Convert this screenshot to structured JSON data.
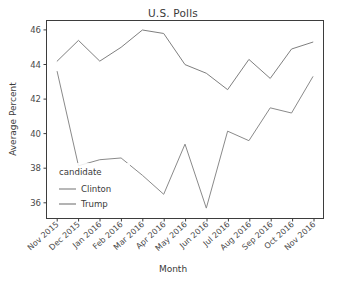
{
  "chart_data": {
    "type": "line",
    "title": "U.S. Polls",
    "xlabel": "Month",
    "ylabel": "Average Percent",
    "categories": [
      "Nov 2015",
      "Dec 2015",
      "Jan 2016",
      "Feb 2016",
      "Mar 2016",
      "Apr 2016",
      "May 2016",
      "Jun 2016",
      "Jul 2016",
      "Aug 2016",
      "Sep 2016",
      "Oct 2016",
      "Nov 2016"
    ],
    "series": [
      {
        "name": "Clinton",
        "color": "#7f7f7f",
        "values": [
          44.0,
          45.2,
          44.0,
          44.8,
          45.8,
          45.6,
          43.8,
          43.3,
          42.35,
          44.1,
          43.0,
          44.7,
          45.1
        ]
      },
      {
        "name": "Trump",
        "color": "#8a8a8a",
        "values": [
          43.4,
          37.95,
          38.3,
          38.4,
          37.4,
          36.3,
          39.2,
          35.5,
          39.95,
          39.4,
          41.3,
          41.0,
          43.1
        ]
      }
    ],
    "ylim": [
      34.9,
      46.35
    ],
    "yticks": [
      36,
      38,
      40,
      42,
      44,
      46
    ],
    "ytick_labels": [
      "36",
      "38",
      "40",
      "42",
      "44",
      "46"
    ],
    "grid": false,
    "legend": {
      "title": "candidate",
      "position": "lower-left",
      "entries": [
        "Clinton",
        "Trump"
      ]
    }
  }
}
